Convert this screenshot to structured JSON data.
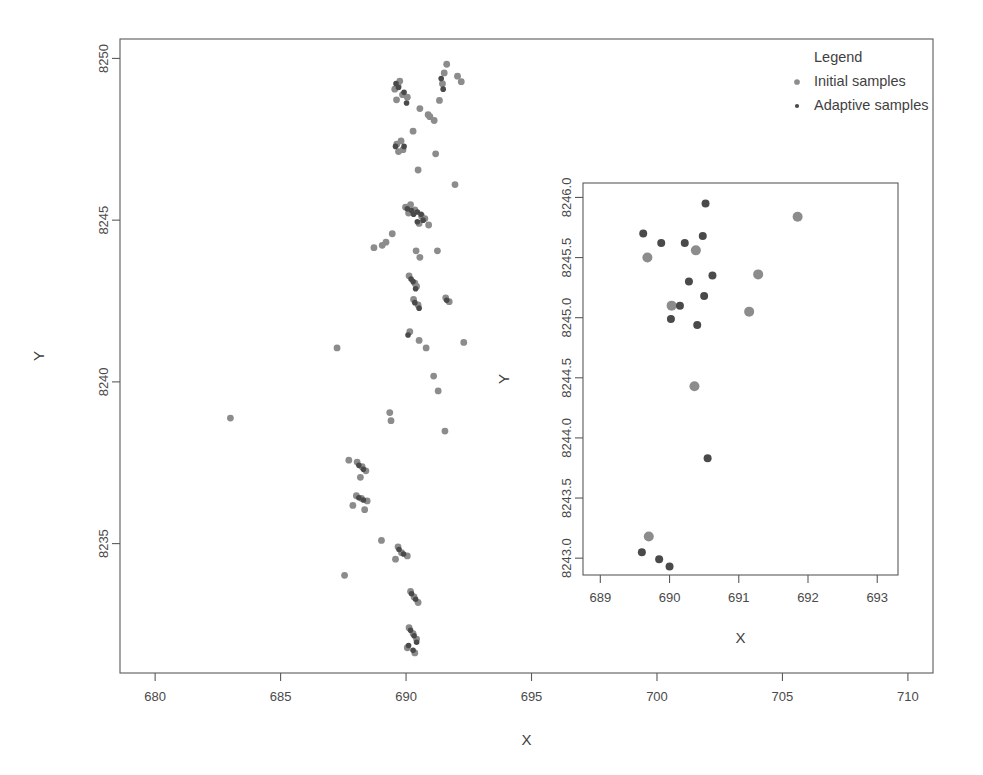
{
  "chart_data": {
    "type": "scatter",
    "title": "",
    "xlabel": "X",
    "ylabel": "Y",
    "xlim": [
      678.6,
      711.0
    ],
    "ylim": [
      8231.0,
      8250.6
    ],
    "grid": false,
    "xticks": [
      680,
      685,
      690,
      695,
      700,
      705,
      710
    ],
    "xtick_labels": [
      "680",
      "685",
      "690",
      "695",
      "700",
      "705",
      "710"
    ],
    "yticks": [
      8235,
      8240,
      8245,
      8250
    ],
    "ytick_labels": [
      "8235",
      "8240",
      "8245",
      "8250"
    ],
    "legend": {
      "title": "Legend",
      "position": "top-right",
      "entries": [
        {
          "name": "Initial samples",
          "color": "#8c8c8c",
          "size": 4.6
        },
        {
          "name": "Adaptive samples",
          "color": "#4a4a4a",
          "size": 3.4
        }
      ]
    },
    "series": [
      {
        "name": "Initial samples",
        "color": "#8c8c8c",
        "marker_size": 3.4,
        "points": [
          [
            689.68,
            8249.15
          ],
          [
            689.75,
            8249.3
          ],
          [
            689.55,
            8249.05
          ],
          [
            689.86,
            8248.88
          ],
          [
            690.05,
            8248.8
          ],
          [
            689.62,
            8248.72
          ],
          [
            691.52,
            8249.55
          ],
          [
            691.45,
            8249.22
          ],
          [
            692.05,
            8249.45
          ],
          [
            692.2,
            8249.28
          ],
          [
            691.33,
            8248.7
          ],
          [
            691.62,
            8249.82
          ],
          [
            690.55,
            8248.45
          ],
          [
            690.88,
            8248.26
          ],
          [
            690.95,
            8248.2
          ],
          [
            691.12,
            8248.08
          ],
          [
            689.63,
            8247.35
          ],
          [
            689.8,
            8247.45
          ],
          [
            689.88,
            8247.18
          ],
          [
            689.7,
            8247.12
          ],
          [
            690.28,
            8247.75
          ],
          [
            691.18,
            8247.05
          ],
          [
            690.48,
            8246.55
          ],
          [
            691.95,
            8246.1
          ],
          [
            689.98,
            8245.4
          ],
          [
            690.1,
            8245.22
          ],
          [
            690.18,
            8245.48
          ],
          [
            690.35,
            8245.32
          ],
          [
            690.62,
            8245.12
          ],
          [
            690.75,
            8245.05
          ],
          [
            690.52,
            8244.9
          ],
          [
            690.9,
            8244.85
          ],
          [
            689.45,
            8244.58
          ],
          [
            689.2,
            8244.32
          ],
          [
            689.05,
            8244.22
          ],
          [
            688.72,
            8244.15
          ],
          [
            690.4,
            8244.05
          ],
          [
            690.55,
            8243.85
          ],
          [
            691.25,
            8244.05
          ],
          [
            690.12,
            8243.28
          ],
          [
            690.35,
            8243.05
          ],
          [
            690.42,
            8242.95
          ],
          [
            690.3,
            8242.55
          ],
          [
            690.48,
            8242.38
          ],
          [
            691.58,
            8242.6
          ],
          [
            691.72,
            8242.48
          ],
          [
            690.15,
            8241.55
          ],
          [
            690.52,
            8241.28
          ],
          [
            690.8,
            8241.05
          ],
          [
            692.3,
            8241.22
          ],
          [
            687.25,
            8241.05
          ],
          [
            691.1,
            8240.18
          ],
          [
            691.28,
            8239.72
          ],
          [
            691.55,
            8238.48
          ],
          [
            689.35,
            8239.05
          ],
          [
            689.4,
            8238.8
          ],
          [
            683.0,
            8238.88
          ],
          [
            688.05,
            8237.52
          ],
          [
            688.25,
            8237.38
          ],
          [
            688.4,
            8237.25
          ],
          [
            688.18,
            8237.05
          ],
          [
            687.72,
            8237.58
          ],
          [
            688.02,
            8236.48
          ],
          [
            688.22,
            8236.4
          ],
          [
            688.45,
            8236.32
          ],
          [
            687.88,
            8236.18
          ],
          [
            688.35,
            8236.05
          ],
          [
            689.02,
            8235.1
          ],
          [
            689.68,
            8234.9
          ],
          [
            689.82,
            8234.72
          ],
          [
            690.05,
            8234.62
          ],
          [
            689.58,
            8234.52
          ],
          [
            687.55,
            8234.02
          ],
          [
            690.18,
            8233.52
          ],
          [
            690.32,
            8233.35
          ],
          [
            690.48,
            8233.18
          ],
          [
            690.12,
            8232.4
          ],
          [
            690.28,
            8232.22
          ],
          [
            690.42,
            8232.05
          ],
          [
            690.05,
            8231.78
          ],
          [
            690.35,
            8231.62
          ]
        ]
      },
      {
        "name": "Adaptive samples",
        "color": "#4a4a4a",
        "marker_size": 2.8,
        "points": [
          [
            689.6,
            8249.22
          ],
          [
            689.7,
            8249.1
          ],
          [
            689.92,
            8248.95
          ],
          [
            691.4,
            8249.38
          ],
          [
            691.48,
            8249.05
          ],
          [
            690.02,
            8248.62
          ],
          [
            689.58,
            8247.28
          ],
          [
            689.92,
            8247.28
          ],
          [
            690.05,
            8245.35
          ],
          [
            690.22,
            8245.3
          ],
          [
            690.3,
            8245.18
          ],
          [
            690.45,
            8245.25
          ],
          [
            690.6,
            8245.18
          ],
          [
            690.68,
            8245.0
          ],
          [
            690.45,
            8244.95
          ],
          [
            690.2,
            8243.18
          ],
          [
            690.28,
            8243.1
          ],
          [
            690.38,
            8242.88
          ],
          [
            690.35,
            8242.45
          ],
          [
            690.52,
            8242.28
          ],
          [
            691.62,
            8242.52
          ],
          [
            690.08,
            8241.45
          ],
          [
            688.12,
            8237.42
          ],
          [
            688.3,
            8237.3
          ],
          [
            688.12,
            8236.42
          ],
          [
            688.3,
            8236.35
          ],
          [
            689.72,
            8234.82
          ],
          [
            689.9,
            8234.68
          ],
          [
            690.22,
            8233.45
          ],
          [
            690.38,
            8233.28
          ],
          [
            690.18,
            8232.32
          ],
          [
            690.32,
            8232.15
          ],
          [
            690.1,
            8231.85
          ],
          [
            690.28,
            8231.7
          ],
          [
            690.42,
            8231.95
          ]
        ]
      }
    ],
    "inset": {
      "xlabel": "X",
      "ylabel": "Y",
      "xlim": [
        688.75,
        693.3
      ],
      "ylim": [
        8242.86,
        8246.12
      ],
      "xticks": [
        689,
        690,
        691,
        692,
        693
      ],
      "xtick_labels": [
        "689",
        "690",
        "691",
        "692",
        "693"
      ],
      "yticks": [
        8243.0,
        8243.5,
        8244.0,
        8244.5,
        8245.0,
        8245.5,
        8246.0
      ],
      "ytick_labels": [
        "8243.0",
        "8243.5",
        "8244.0",
        "8244.5",
        "8245.0",
        "8245.5",
        "8246.0"
      ],
      "series": [
        {
          "name": "Initial samples",
          "color": "#8c8c8c",
          "marker_size": 5.0,
          "points": [
            [
              691.85,
              8245.84
            ],
            [
              689.68,
              8245.5
            ],
            [
              690.38,
              8245.56
            ],
            [
              691.28,
              8245.36
            ],
            [
              690.03,
              8245.1
            ],
            [
              691.15,
              8245.05
            ],
            [
              690.36,
              8244.43
            ],
            [
              689.7,
              8243.18
            ]
          ]
        },
        {
          "name": "Adaptive samples",
          "color": "#4a4a4a",
          "marker_size": 4.0,
          "points": [
            [
              690.52,
              8245.95
            ],
            [
              689.62,
              8245.7
            ],
            [
              690.48,
              8245.68
            ],
            [
              689.88,
              8245.62
            ],
            [
              690.22,
              8245.62
            ],
            [
              690.62,
              8245.35
            ],
            [
              690.28,
              8245.3
            ],
            [
              690.5,
              8245.18
            ],
            [
              690.15,
              8245.1
            ],
            [
              690.02,
              8244.99
            ],
            [
              690.4,
              8244.94
            ],
            [
              690.55,
              8243.83
            ],
            [
              689.6,
              8243.05
            ],
            [
              689.85,
              8242.99
            ],
            [
              690.0,
              8242.93
            ]
          ]
        }
      ]
    }
  }
}
